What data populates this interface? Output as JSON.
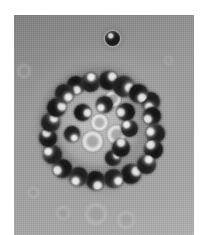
{
  "figure": {
    "kind": "micrograph",
    "modality": "brightfield-phase-contrast",
    "caption": "",
    "background_color": "#9a9a9a",
    "margin_color": "#ffffff",
    "cell_dark_color": "#1c1c1c",
    "cell_highlight_color": "#f0f0f0",
    "cell_pale_color": "#d6d6d6",
    "plate": {
      "x": 14,
      "y": 15,
      "width": 180,
      "height": 220
    },
    "halo": {
      "cx": 100,
      "cy": 128,
      "r": 62
    },
    "lumen": {
      "cx": 98,
      "cy": 126,
      "r": 40
    }
  },
  "cells": [
    {
      "name": "solitary-cell",
      "type": "solo",
      "cx": 112,
      "cy": 38,
      "r": 7.5
    },
    {
      "name": "rosette-cell-01",
      "type": "dark",
      "cx": 90,
      "cy": 82,
      "r": 9.5
    },
    {
      "name": "rosette-cell-02",
      "type": "dark2",
      "cx": 108,
      "cy": 80,
      "r": 9.5
    },
    {
      "name": "rosette-cell-03",
      "type": "dark",
      "cx": 123,
      "cy": 86,
      "r": 10.5
    },
    {
      "name": "rosette-cell-04",
      "type": "dark2",
      "cx": 138,
      "cy": 93,
      "r": 9.5
    },
    {
      "name": "rosette-cell-05",
      "type": "dark",
      "cx": 150,
      "cy": 101,
      "r": 9.5
    },
    {
      "name": "rosette-cell-06",
      "type": "dark2",
      "cx": 152,
      "cy": 116,
      "r": 9.0
    },
    {
      "name": "rosette-cell-07",
      "type": "dark",
      "cx": 155,
      "cy": 133,
      "r": 9.5
    },
    {
      "name": "rosette-cell-08",
      "type": "dark2",
      "cx": 153,
      "cy": 149,
      "r": 9.5
    },
    {
      "name": "rosette-cell-09",
      "type": "dark",
      "cx": 146,
      "cy": 164,
      "r": 9.5
    },
    {
      "name": "rosette-cell-10",
      "type": "dark2",
      "cx": 131,
      "cy": 174,
      "r": 10.0
    },
    {
      "name": "rosette-cell-11",
      "type": "dark",
      "cx": 113,
      "cy": 178,
      "r": 9.5
    },
    {
      "name": "rosette-cell-12",
      "type": "dark2",
      "cx": 95,
      "cy": 180,
      "r": 9.5
    },
    {
      "name": "rosette-cell-13",
      "type": "dark",
      "cx": 78,
      "cy": 176,
      "r": 9.5
    },
    {
      "name": "rosette-cell-14",
      "type": "dark2",
      "cx": 62,
      "cy": 168,
      "r": 9.5
    },
    {
      "name": "rosette-cell-15",
      "type": "dark",
      "cx": 52,
      "cy": 154,
      "r": 9.5
    },
    {
      "name": "rosette-cell-16",
      "type": "dark2",
      "cx": 48,
      "cy": 138,
      "r": 9.0
    },
    {
      "name": "rosette-cell-17",
      "type": "dark",
      "cx": 50,
      "cy": 122,
      "r": 9.5
    },
    {
      "name": "rosette-cell-18",
      "type": "dark2",
      "cx": 56,
      "cy": 107,
      "r": 9.5
    },
    {
      "name": "rosette-cell-19",
      "type": "dark",
      "cx": 64,
      "cy": 93,
      "r": 9.5
    },
    {
      "name": "rosette-cell-20",
      "type": "dark2",
      "cx": 76,
      "cy": 85,
      "r": 9.0
    },
    {
      "name": "inner-cell-01",
      "type": "dark",
      "cx": 104,
      "cy": 104,
      "r": 8.5
    },
    {
      "name": "inner-cell-02",
      "type": "dark2",
      "cx": 126,
      "cy": 112,
      "r": 9.0
    },
    {
      "name": "inner-cell-03",
      "type": "dark",
      "cx": 129,
      "cy": 128,
      "r": 8.5
    },
    {
      "name": "inner-cell-04",
      "type": "dark2",
      "cx": 121,
      "cy": 148,
      "r": 9.0
    },
    {
      "name": "inner-cell-05",
      "type": "dark",
      "cx": 113,
      "cy": 158,
      "r": 8.0
    },
    {
      "name": "inner-cell-06",
      "type": "dark2",
      "cx": 82,
      "cy": 112,
      "r": 8.5
    },
    {
      "name": "inner-cell-07",
      "type": "dark",
      "cx": 72,
      "cy": 134,
      "r": 8.0
    },
    {
      "name": "center-target-cell",
      "type": "pale",
      "cx": 92,
      "cy": 141,
      "r": 10.5
    },
    {
      "name": "center-pale-cell-02",
      "type": "pale",
      "cx": 116,
      "cy": 134,
      "r": 9.5
    },
    {
      "name": "center-pale-cell-03",
      "type": "pale",
      "cx": 99,
      "cy": 122,
      "r": 8.5
    },
    {
      "name": "center-pale-cell-04",
      "type": "pale",
      "cx": 113,
      "cy": 99,
      "r": 8.0
    },
    {
      "name": "background-ghost-cell-01",
      "type": "ghost",
      "cx": 24,
      "cy": 71,
      "r": 7.0
    },
    {
      "name": "background-ghost-cell-02",
      "type": "ghost",
      "cx": 33,
      "cy": 192,
      "r": 5.5
    },
    {
      "name": "background-ghost-cell-03",
      "type": "ghost",
      "cx": 96,
      "cy": 214,
      "r": 11.0
    },
    {
      "name": "background-ghost-cell-04",
      "type": "ghost",
      "cx": 126,
      "cy": 220,
      "r": 9.0
    },
    {
      "name": "background-ghost-cell-05",
      "type": "ghost",
      "cx": 168,
      "cy": 60,
      "r": 4.5
    },
    {
      "name": "background-ghost-cell-06",
      "type": "ghost",
      "cx": 63,
      "cy": 213,
      "r": 7.0
    }
  ]
}
